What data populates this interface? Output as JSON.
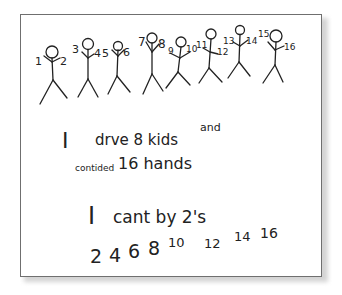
{
  "colors": {
    "ink": "#222222",
    "paper": "#ffffff",
    "border": "#6f6f6f",
    "shadow": "#d4d4d4"
  },
  "figures": [
    {
      "id": 1,
      "hands": [
        "1",
        "2"
      ]
    },
    {
      "id": 2,
      "hands": [
        "3",
        "4"
      ]
    },
    {
      "id": 3,
      "hands": [
        "5",
        "6"
      ]
    },
    {
      "id": 4,
      "hands": [
        "7",
        "8"
      ]
    },
    {
      "id": 5,
      "hands": [
        "9",
        "10"
      ]
    },
    {
      "id": 6,
      "hands": [
        "11",
        "12"
      ]
    },
    {
      "id": 7,
      "hands": [
        "13",
        "14"
      ]
    },
    {
      "id": 8,
      "hands": [
        "15",
        "16"
      ]
    }
  ],
  "text": {
    "line1_i": "I",
    "line1_rest": "drve 8 kids",
    "line1_and": "and",
    "line2_word": "contided",
    "line2_rest": "16 hands",
    "line3_i": "I",
    "line3_rest": "cant by 2's",
    "counting": [
      "2",
      "4",
      "6",
      "8",
      "10",
      "12",
      "14",
      "16"
    ]
  }
}
